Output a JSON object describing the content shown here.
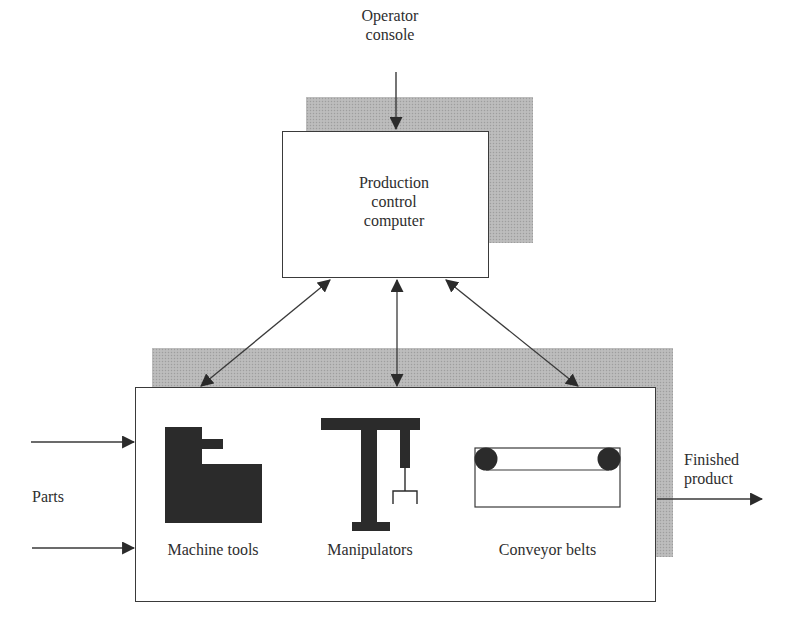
{
  "diagram": {
    "type": "block-diagram",
    "operator_console": {
      "label_line1": "Operator",
      "label_line2": "console"
    },
    "control_computer": {
      "label_line1": "Production",
      "label_line2": "control",
      "label_line3": "computer"
    },
    "cell": {
      "components": [
        {
          "label": "Machine tools",
          "icon": "machine-tool-icon"
        },
        {
          "label": "Manipulators",
          "icon": "manipulator-icon"
        },
        {
          "label": "Conveyor belts",
          "icon": "conveyor-belt-icon"
        }
      ]
    },
    "input": {
      "label": "Parts",
      "arrow_count": 2
    },
    "output": {
      "label_line1": "Finished",
      "label_line2": "product"
    },
    "connections": [
      {
        "from": "Operator console",
        "to": "Production control computer",
        "direction": "one-way"
      },
      {
        "from": "Production control computer",
        "to": "Machine tools",
        "direction": "two-way"
      },
      {
        "from": "Production control computer",
        "to": "Manipulators",
        "direction": "two-way"
      },
      {
        "from": "Production control computer",
        "to": "Conveyor belts",
        "direction": "two-way"
      },
      {
        "from": "Parts",
        "to": "Manufacturing cell",
        "direction": "one-way"
      },
      {
        "from": "Manufacturing cell",
        "to": "Finished product",
        "direction": "one-way"
      }
    ],
    "colors": {
      "line": "#3a3a3a",
      "shadow": "#b8b8b8",
      "icon_fill": "#2b2b2b",
      "background": "#ffffff"
    }
  }
}
